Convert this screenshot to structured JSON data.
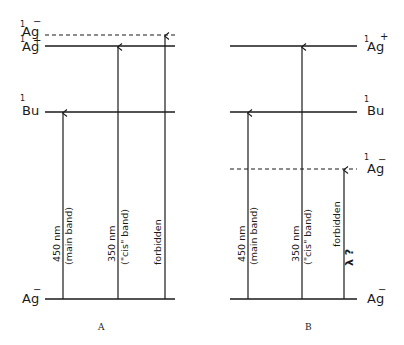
{
  "figure": {
    "panels": [
      {
        "caption": "A",
        "levels": [
          {
            "spin": "1",
            "symbol": "Ag",
            "sign": "−",
            "style": "dashed"
          },
          {
            "spin": "1",
            "symbol": "Ag",
            "sign": "+",
            "style": "solid"
          },
          {
            "spin": "1",
            "symbol": "Bu",
            "sign": "",
            "style": "solid"
          },
          {
            "spin": "",
            "symbol": "Ag",
            "sign": "−",
            "style": "solid"
          }
        ],
        "transitions": [
          {
            "line1": "450 nm",
            "line2": "(main band)",
            "to": "1Bu"
          },
          {
            "line1": "350 nm",
            "line2": "(\"cis\" band)",
            "to": "1Ag+"
          },
          {
            "line1": "forbidden",
            "line2": "",
            "to": "1Ag-"
          }
        ]
      },
      {
        "caption": "B",
        "levels": [
          {
            "spin": "1",
            "symbol": "Ag",
            "sign": "+",
            "style": "solid"
          },
          {
            "spin": "1",
            "symbol": "Bu",
            "sign": "",
            "style": "solid"
          },
          {
            "spin": "1",
            "symbol": "Ag",
            "sign": "−",
            "style": "dashed"
          },
          {
            "spin": "",
            "symbol": "Ag",
            "sign": "−",
            "style": "solid"
          }
        ],
        "transitions": [
          {
            "line1": "450 nm",
            "line2": "(main band)",
            "to": "1Bu"
          },
          {
            "line1": "350 nm",
            "line2": "(\"cis\" band)",
            "to": "1Ag+"
          },
          {
            "line1": "forbidden",
            "line2": "λ ?",
            "to": "1Ag-"
          }
        ]
      }
    ]
  }
}
